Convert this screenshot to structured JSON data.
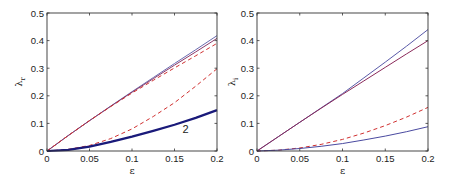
{
  "chart_data": [
    {
      "type": "line",
      "panel": "left",
      "title": "",
      "xlabel": "ε",
      "ylabel": "λr",
      "xlim": [
        0,
        0.2
      ],
      "ylim": [
        0,
        0.5
      ],
      "xticks": [
        "0",
        "0.05",
        "0.1",
        "0.15",
        "0.2"
      ],
      "yticks": [
        "0",
        "0.1",
        "0.2",
        "0.3",
        "0.4",
        "0.5"
      ],
      "grid": false,
      "legend": null,
      "annotations": [
        {
          "text": "2",
          "x": 0.163,
          "y": 0.065
        }
      ],
      "x": [
        0,
        0.025,
        0.05,
        0.075,
        0.1,
        0.125,
        0.15,
        0.175,
        0.2
      ],
      "series": [
        {
          "name": "solid-upper-1",
          "color": "#6b6bb0",
          "style": "solid",
          "values": [
            0,
            0.056,
            0.11,
            0.163,
            0.215,
            0.266,
            0.317,
            0.367,
            0.418
          ]
        },
        {
          "name": "solid-upper-2",
          "color": "#8a3a6a",
          "style": "solid",
          "values": [
            0,
            0.056,
            0.11,
            0.162,
            0.213,
            0.262,
            0.311,
            0.359,
            0.408
          ]
        },
        {
          "name": "dashed-upper",
          "color": "#d03030",
          "style": "dashed",
          "values": [
            0,
            0.056,
            0.11,
            0.161,
            0.21,
            0.256,
            0.301,
            0.345,
            0.39
          ]
        },
        {
          "name": "dashed-lower",
          "color": "#d03030",
          "style": "dashed",
          "values": [
            0,
            0.006,
            0.02,
            0.045,
            0.08,
            0.125,
            0.175,
            0.235,
            0.298
          ]
        },
        {
          "name": "solid-thick-2",
          "color": "#1a1a7a",
          "style": "solid",
          "values": [
            0,
            0.004,
            0.016,
            0.033,
            0.052,
            0.073,
            0.095,
            0.12,
            0.148
          ]
        }
      ]
    },
    {
      "type": "line",
      "panel": "right",
      "title": "",
      "xlabel": "ε",
      "ylabel": "λi",
      "xlim": [
        0,
        0.2
      ],
      "ylim": [
        0,
        0.5
      ],
      "xticks": [
        "0",
        "0.05",
        "0.1",
        "0.15",
        "0.2"
      ],
      "yticks": [
        "0",
        "0.1",
        "0.2",
        "0.3",
        "0.4",
        "0.5"
      ],
      "grid": false,
      "legend": null,
      "annotations": [],
      "x": [
        0,
        0.025,
        0.05,
        0.075,
        0.1,
        0.125,
        0.15,
        0.175,
        0.2
      ],
      "series": [
        {
          "name": "solid-upper-blue",
          "color": "#5a5aa8",
          "style": "solid",
          "values": [
            0,
            0.052,
            0.104,
            0.156,
            0.208,
            0.265,
            0.322,
            0.38,
            0.44
          ]
        },
        {
          "name": "solid-upper-purple",
          "color": "#8a2a5a",
          "style": "solid",
          "values": [
            0,
            0.052,
            0.104,
            0.155,
            0.205,
            0.254,
            0.303,
            0.352,
            0.4
          ]
        },
        {
          "name": "dashed-lower",
          "color": "#d03030",
          "style": "dashed",
          "values": [
            0,
            0.003,
            0.011,
            0.024,
            0.042,
            0.065,
            0.092,
            0.123,
            0.158
          ]
        },
        {
          "name": "solid-lower-blue",
          "color": "#4a4aa0",
          "style": "solid",
          "values": [
            0,
            0.003,
            0.009,
            0.017,
            0.027,
            0.04,
            0.054,
            0.07,
            0.088
          ]
        }
      ]
    }
  ]
}
